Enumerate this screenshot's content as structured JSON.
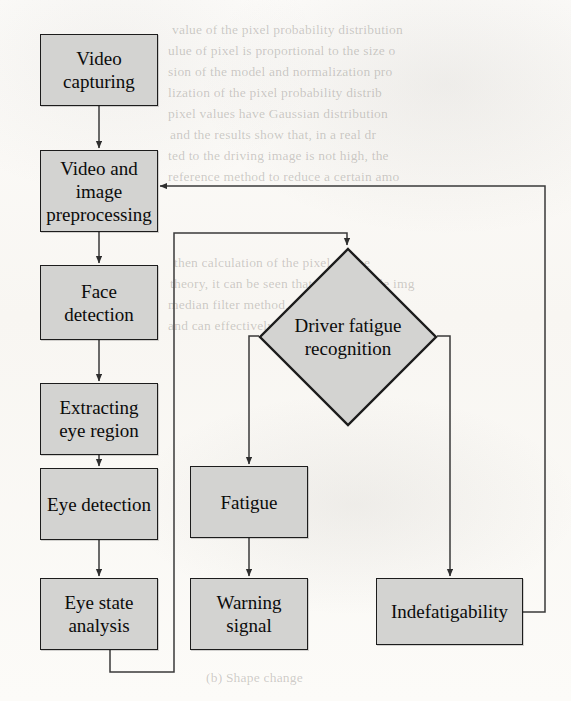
{
  "diagram": {
    "style": {
      "node_fill": "#d3d3d1",
      "node_border": "#1c1c1c",
      "connector": "#3a3a3a",
      "page_background": "#fbfaf8",
      "text_color": "#0b0b0b"
    },
    "nodes": [
      {
        "id": "video_capturing",
        "label": "Video capturing",
        "shape": "rect",
        "x": 40,
        "y": 34,
        "w": 118,
        "h": 72
      },
      {
        "id": "preprocessing",
        "label": "Video and image preprocessing",
        "shape": "rect",
        "x": 40,
        "y": 150,
        "w": 118,
        "h": 82
      },
      {
        "id": "face_detection",
        "label": "Face detection",
        "shape": "rect",
        "x": 40,
        "y": 265,
        "w": 118,
        "h": 75
      },
      {
        "id": "extract_eye",
        "label": "Extracting eye region",
        "shape": "rect",
        "x": 40,
        "y": 383,
        "w": 118,
        "h": 72
      },
      {
        "id": "eye_detection",
        "label": "Eye detection",
        "shape": "rect",
        "x": 40,
        "y": 468,
        "w": 118,
        "h": 72
      },
      {
        "id": "eye_state",
        "label": "Eye state analysis",
        "shape": "rect",
        "x": 40,
        "y": 578,
        "w": 118,
        "h": 72
      },
      {
        "id": "recognition",
        "label": "Driver fatigue recognition",
        "shape": "diamond",
        "x": 258,
        "y": 247,
        "w": 180,
        "h": 180
      },
      {
        "id": "fatigue",
        "label": "Fatigue",
        "shape": "rect",
        "x": 190,
        "y": 466,
        "w": 118,
        "h": 72
      },
      {
        "id": "warning_signal",
        "label": "Warning signal",
        "shape": "rect",
        "x": 190,
        "y": 578,
        "w": 118,
        "h": 72
      },
      {
        "id": "indefatigability",
        "label": "Indefatigability",
        "shape": "rect",
        "x": 376,
        "y": 578,
        "w": 147,
        "h": 67
      }
    ],
    "edges": [
      {
        "id": "e1",
        "from": "video_capturing",
        "to": "preprocessing",
        "label": ""
      },
      {
        "id": "e2",
        "from": "preprocessing",
        "to": "face_detection",
        "label": ""
      },
      {
        "id": "e3",
        "from": "face_detection",
        "to": "extract_eye",
        "label": ""
      },
      {
        "id": "e4",
        "from": "extract_eye",
        "to": "eye_detection",
        "label": ""
      },
      {
        "id": "e5",
        "from": "eye_detection",
        "to": "eye_state",
        "label": ""
      },
      {
        "id": "e6",
        "from": "eye_state",
        "to": "recognition",
        "label": ""
      },
      {
        "id": "e7",
        "from": "recognition",
        "to": "fatigue",
        "label": ""
      },
      {
        "id": "e8",
        "from": "fatigue",
        "to": "warning_signal",
        "label": ""
      },
      {
        "id": "e9",
        "from": "recognition",
        "to": "indefatigability",
        "label": ""
      },
      {
        "id": "e10",
        "from": "indefatigability",
        "to": "preprocessing",
        "label": ""
      }
    ]
  },
  "background_text": {
    "lines": [
      {
        "text": "value of the pixel probability distribution",
        "x": 172,
        "y": 20
      },
      {
        "text": "ulue of pixel is proportional to the size o",
        "x": 168,
        "y": 41
      },
      {
        "text": "sion of the model and normalization pro",
        "x": 168,
        "y": 62
      },
      {
        "text": "lization of the pixel probability distrib",
        "x": 168,
        "y": 83
      },
      {
        "text": "pixel values have Gaussian distribution",
        "x": 168,
        "y": 104
      },
      {
        "text": "and the results show that, in a real dr",
        "x": 170,
        "y": 125
      },
      {
        "text": "ted to the driving image is not high, the",
        "x": 168,
        "y": 146
      },
      {
        "text": "reference method to reduce a certain amo",
        "x": 168,
        "y": 167
      },
      {
        "text": "then calculation of the pixel can be",
        "x": 174,
        "y": 253
      },
      {
        "text": "theory, it can be seen that the grayscale img",
        "x": 170,
        "y": 274
      },
      {
        "text": "median filter method, which can reduce",
        "x": 168,
        "y": 295
      },
      {
        "text": "and can effectively filter the noise in",
        "x": 168,
        "y": 316
      },
      {
        "text": "(b) Shape change",
        "x": 206,
        "y": 668
      }
    ]
  }
}
